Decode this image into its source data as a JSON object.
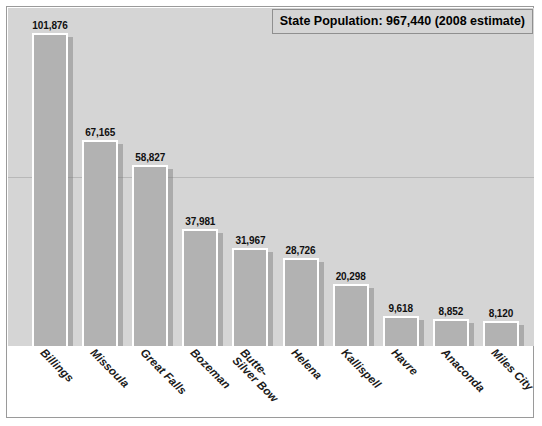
{
  "title": {
    "text": "State Population: 967,440 (2008 estimate)"
  },
  "colors": {
    "plot_background": "#d5d5d5",
    "bar_fill": "#b2b2b2",
    "bar_outline": "#ffffff",
    "frame": "#9a9a9a",
    "text": "#101010"
  },
  "chart_data": {
    "type": "bar",
    "title": "State Population: 967,440 (2008 estimate)",
    "xlabel": "",
    "ylabel": "",
    "ylim": [
      0,
      110000
    ],
    "grid": true,
    "legend": null,
    "categories": [
      "Billings",
      "Missoula",
      "Great Falls",
      "Bozeman",
      "Butte-\nSilver Bow",
      "Helena",
      "Kallispell",
      "Havre",
      "Anaconda",
      "Miles City"
    ],
    "values": [
      101876,
      67165,
      58827,
      37981,
      31967,
      28726,
      20298,
      9618,
      8852,
      8120
    ],
    "value_labels": [
      "101,876",
      "67,165",
      "58,827",
      "37,981",
      "31,967",
      "28,726",
      "20,298",
      "9,618",
      "8,852",
      "8,120"
    ],
    "bars": [
      {
        "category": "Billings",
        "label_line1": "Billings",
        "label_line2": "",
        "value": 101876,
        "value_label": "101,876"
      },
      {
        "category": "Missoula",
        "label_line1": "Missoula",
        "label_line2": "",
        "value": 67165,
        "value_label": "67,165"
      },
      {
        "category": "Great Falls",
        "label_line1": "Great Falls",
        "label_line2": "",
        "value": 58827,
        "value_label": "58,827"
      },
      {
        "category": "Bozeman",
        "label_line1": "Bozeman",
        "label_line2": "",
        "value": 37981,
        "value_label": "37,981"
      },
      {
        "category": "Butte-Silver Bow",
        "label_line1": "Butte-",
        "label_line2": "Silver Bow",
        "value": 31967,
        "value_label": "31,967"
      },
      {
        "category": "Helena",
        "label_line1": "Helena",
        "label_line2": "",
        "value": 28726,
        "value_label": "28,726"
      },
      {
        "category": "Kallispell",
        "label_line1": "Kallispell",
        "label_line2": "",
        "value": 20298,
        "value_label": "20,298"
      },
      {
        "category": "Havre",
        "label_line1": "Havre",
        "label_line2": "",
        "value": 9618,
        "value_label": "9,618"
      },
      {
        "category": "Anaconda",
        "label_line1": "Anaconda",
        "label_line2": "",
        "value": 8852,
        "value_label": "8,852"
      },
      {
        "category": "Miles City",
        "label_line1": "Miles City",
        "label_line2": "",
        "value": 8120,
        "value_label": "8,120"
      }
    ],
    "gridline_values": [
      55000
    ]
  }
}
